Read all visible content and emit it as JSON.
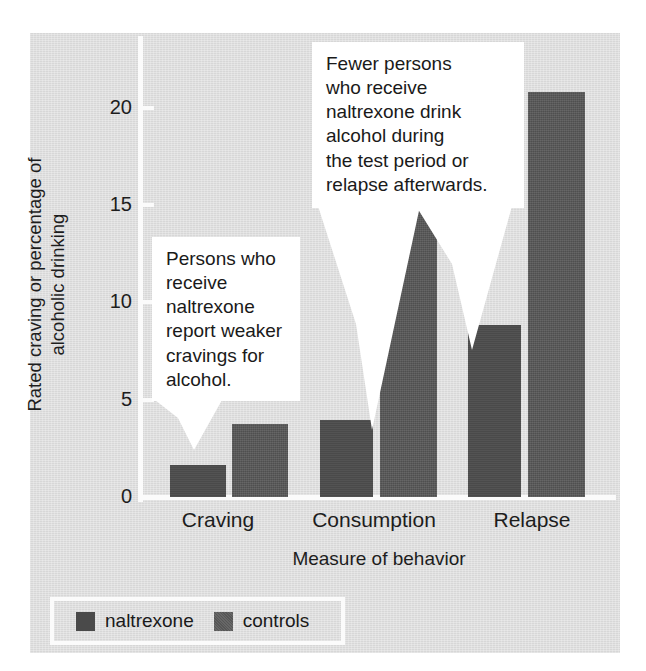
{
  "chart_data": {
    "type": "bar",
    "title": "",
    "categories": [
      "Craving",
      "Consumption",
      "Relapse"
    ],
    "series": [
      {
        "name": "naltrexone",
        "values": [
          1.5,
          3.6,
          8.0
        ],
        "color": "#4a4a4a"
      },
      {
        "name": "controls",
        "values": [
          3.4,
          14.0,
          18.9
        ],
        "color": "#4f4f4f"
      }
    ],
    "xlabel": "Measure of behavior",
    "ylabel": "Rated craving or percentage of alcoholic drinking",
    "ylim": [
      0,
      21.5
    ],
    "yticks": [
      0,
      5,
      10,
      15,
      20
    ],
    "ytick_labels": [
      "0",
      "5",
      "10",
      "15",
      "20"
    ],
    "grid": false,
    "legend_position": "bottom-left"
  },
  "axis": {
    "y_title_line1": "Rated craving or percentage of",
    "y_title_line2": "alcoholic drinking",
    "x_title": "Measure of behavior",
    "tick_0": "0",
    "tick_5": "5",
    "tick_10": "10",
    "tick_15": "15",
    "tick_20": "20"
  },
  "categories": {
    "craving": "Craving",
    "consumption": "Consumption",
    "relapse": "Relapse"
  },
  "callouts": [
    {
      "id": "craving-callout",
      "text": "Persons who receive naltrexone report weaker cravings for alcohol.",
      "lines": [
        "Persons who",
        "receive",
        "naltrexone",
        "report weaker",
        "cravings for",
        "alcohol."
      ]
    },
    {
      "id": "consumption-relapse-callout",
      "text": "Fewer persons who receive naltrexone drink alcohol during the test period or relapse afterwards.",
      "lines": [
        "Fewer persons",
        "who receive",
        "naltrexone drink",
        "alcohol during",
        "the test period or",
        "relapse afterwards."
      ]
    }
  ],
  "legend": {
    "entries": [
      {
        "label": "naltrexone",
        "color": "#4a4a4a"
      },
      {
        "label": "controls",
        "color": "#565656"
      }
    ]
  },
  "colors": {
    "panel_background": "#d7d7d7",
    "axis_line": "#fbfbfb",
    "text": "#1d1d1d",
    "naltrexone_bar": "#4a4a4a",
    "controls_bar": "#4f4f4f",
    "callout_background": "#ffffff"
  }
}
